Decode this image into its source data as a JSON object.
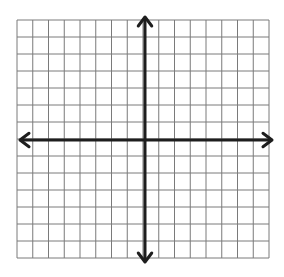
{
  "diagram": {
    "type": "coordinate-plane",
    "grid": {
      "columns": 16,
      "rows": 14,
      "columns_left_of_y_axis": 8,
      "columns_right_of_y_axis": 8,
      "rows_above_x_axis": 7,
      "rows_below_x_axis": 7,
      "left": 17,
      "right": 269,
      "top": 20,
      "bottom": 258,
      "line_color": "#7a7a7a",
      "line_width": 1
    },
    "axes": {
      "origin_x": 145,
      "origin_y": 140,
      "color": "#1e1e1e",
      "width": 3,
      "x_axis": {
        "from": 20,
        "to": 272,
        "arrows": [
          "left",
          "right"
        ]
      },
      "y_axis": {
        "from": 17,
        "to": 262,
        "arrows": [
          "up",
          "down"
        ]
      }
    },
    "labels": []
  }
}
